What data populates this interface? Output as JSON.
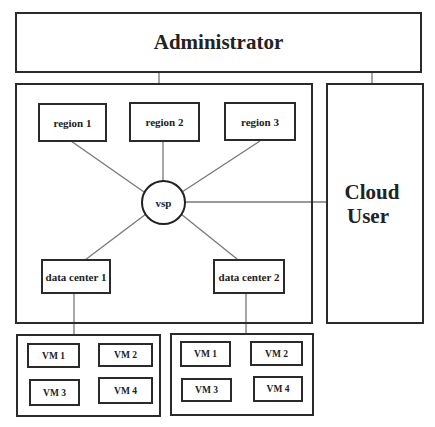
{
  "diagram": {
    "administrator": {
      "label": "Administrator"
    },
    "cloud_user": {
      "line1": "Cloud",
      "line2": "User"
    },
    "hub": {
      "label": "vsp"
    },
    "regions": [
      {
        "label": "region 1"
      },
      {
        "label": "region 2"
      },
      {
        "label": "region 3"
      }
    ],
    "data_centers": [
      {
        "label": "data center 1",
        "vms": [
          "VM 1",
          "VM 2",
          "VM 3",
          "VM 4"
        ]
      },
      {
        "label": "data center 2",
        "vms": [
          "VM 1",
          "VM 2",
          "VM 3",
          "VM 4"
        ]
      }
    ],
    "edges": [
      [
        "Administrator",
        "vsp-container"
      ],
      [
        "Administrator",
        "Cloud User"
      ],
      [
        "vsp",
        "region 1"
      ],
      [
        "vsp",
        "region 2"
      ],
      [
        "vsp",
        "region 3"
      ],
      [
        "vsp",
        "Cloud User"
      ],
      [
        "vsp",
        "data center 1"
      ],
      [
        "vsp",
        "data center 2"
      ],
      [
        "data center 1",
        "VM group 1"
      ],
      [
        "data center 2",
        "VM group 2"
      ]
    ]
  }
}
